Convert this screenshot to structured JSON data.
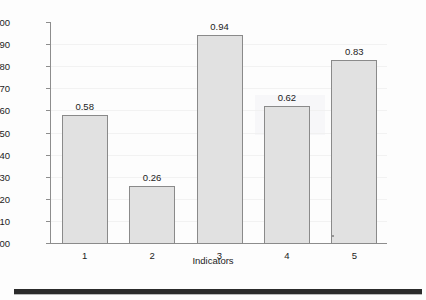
{
  "chart_data": {
    "type": "bar",
    "title": "",
    "xlabel": "Indicators",
    "ylabel": "",
    "categories": [
      "1",
      "2",
      "3",
      "4",
      "5"
    ],
    "values": [
      0.58,
      0.26,
      0.94,
      0.62,
      0.83
    ],
    "value_labels": [
      "0.58",
      "0.26",
      "0.94",
      "0.62",
      "0.83"
    ],
    "ylim": [
      0.0,
      1.0
    ],
    "ytick_labels": [
      "1.00",
      "0.90",
      "0.80",
      "0.70",
      "0.60",
      "0.50",
      "0.40",
      "0.30",
      "0.20",
      "0.10",
      "0.00"
    ],
    "ytick_values": [
      1.0,
      0.9,
      0.8,
      0.7,
      0.6,
      0.5,
      0.4,
      0.3,
      0.2,
      0.1,
      0.0
    ],
    "grid": true,
    "legend": false,
    "bar_fill_color": "#e1e1e1",
    "bar_border_color": "#8a8a8a",
    "axis_color": "#8d8d8d",
    "text_color": "#1c1c1c"
  },
  "page": {
    "background_color": "#fdfdfd",
    "bottom_rule_color": "#2b2b2b"
  }
}
